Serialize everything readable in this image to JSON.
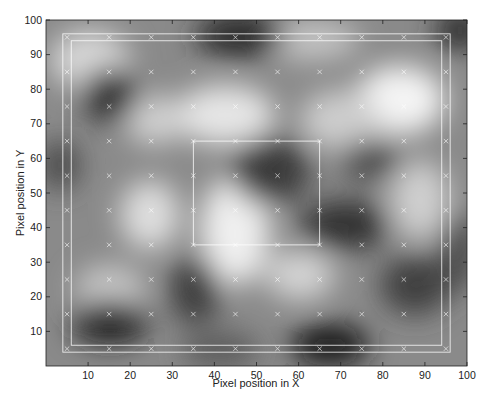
{
  "chart_data": {
    "type": "heatmap",
    "title": "",
    "xlabel": "Pixel position in X",
    "ylabel": "Pixel position in Y",
    "xlim": [
      0,
      100
    ],
    "ylim": [
      0,
      100
    ],
    "grid": false,
    "colormap": "gray",
    "x_ticks": [
      10,
      20,
      30,
      40,
      50,
      60,
      70,
      80,
      90,
      100
    ],
    "y_ticks": [
      10,
      20,
      30,
      40,
      50,
      60,
      70,
      80,
      90,
      100
    ],
    "overlays": {
      "outer_rectangle": {
        "x0": 4,
        "y0": 4,
        "x1": 96,
        "y1": 96,
        "color": "#ffffff"
      },
      "inner_rectangle": {
        "x0": 6,
        "y0": 6,
        "x1": 94,
        "y1": 94,
        "color": "#ffffff"
      },
      "center_rectangle": {
        "x0": 35,
        "y0": 35,
        "x1": 65,
        "y1": 65,
        "color": "#ffffff"
      },
      "markers": {
        "symbol": "x",
        "color": "#ffffff",
        "x": [
          5,
          15,
          25,
          35,
          45,
          55,
          65,
          75,
          85,
          95
        ],
        "y": [
          5,
          15,
          25,
          35,
          45,
          55,
          65,
          75,
          85,
          95
        ]
      }
    },
    "intensity_features": [
      {
        "x": 15,
        "y": 78,
        "value": "dark"
      },
      {
        "x": 15,
        "y": 13,
        "value": "dark"
      },
      {
        "x": 47,
        "y": 95,
        "value": "dark"
      },
      {
        "x": 67,
        "y": 8,
        "value": "dark"
      },
      {
        "x": 55,
        "y": 58,
        "value": "dark"
      },
      {
        "x": 36,
        "y": 22,
        "value": "dark"
      },
      {
        "x": 72,
        "y": 45,
        "value": "dark"
      },
      {
        "x": 88,
        "y": 22,
        "value": "dark"
      },
      {
        "x": 84,
        "y": 76,
        "value": "bright"
      },
      {
        "x": 45,
        "y": 40,
        "value": "bright"
      },
      {
        "x": 42,
        "y": 73,
        "value": "bright"
      },
      {
        "x": 25,
        "y": 42,
        "value": "bright"
      },
      {
        "x": 10,
        "y": 90,
        "value": "bright"
      },
      {
        "x": 60,
        "y": 30,
        "value": "bright"
      }
    ]
  }
}
